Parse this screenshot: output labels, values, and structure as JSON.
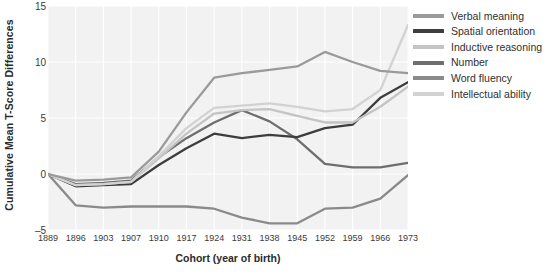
{
  "chart_data": {
    "type": "line",
    "title": "",
    "xlabel": "Cohort (year of birth)",
    "ylabel": "Cumulative Mean T-Score Differences",
    "categories": [
      1889,
      1896,
      1903,
      1907,
      1910,
      1917,
      1924,
      1931,
      1938,
      1945,
      1952,
      1959,
      1966,
      1973
    ],
    "xtick_labels": [
      "1889",
      "1896",
      "1903",
      "1907",
      "1910",
      "1917",
      "1924",
      "1931",
      "1938",
      "1945",
      "1952",
      "1959",
      "1966",
      "1973"
    ],
    "ytick_labels": [
      "15",
      "10",
      "5",
      "0",
      "–5"
    ],
    "ytick_values": [
      15,
      10,
      5,
      0,
      -5
    ],
    "ylim": [
      -5,
      15
    ],
    "grid": true,
    "legend_position": "right",
    "series": [
      {
        "name": "Verbal meaning",
        "color": "#9a9a9a",
        "values": [
          0.0,
          -0.6,
          -0.5,
          -0.3,
          2.0,
          5.5,
          8.6,
          9.0,
          9.3,
          9.6,
          10.9,
          10.0,
          9.2,
          9.0
        ]
      },
      {
        "name": "Spatial orientation",
        "color": "#3d3d3d",
        "values": [
          0.0,
          -1.1,
          -1.0,
          -0.9,
          0.8,
          2.3,
          3.6,
          3.2,
          3.5,
          3.3,
          4.1,
          4.4,
          6.8,
          8.2
        ]
      },
      {
        "name": "Inductive reasoning",
        "color": "#c4c4c4",
        "values": [
          0.0,
          -1.0,
          -0.9,
          -0.7,
          1.4,
          3.6,
          5.4,
          5.7,
          5.8,
          5.2,
          4.6,
          4.6,
          6.0,
          7.8
        ]
      },
      {
        "name": "Number",
        "color": "#6e6e6e",
        "values": [
          0.0,
          -0.9,
          -0.8,
          -0.6,
          1.5,
          3.2,
          4.6,
          5.7,
          4.7,
          3.1,
          0.9,
          0.6,
          0.6,
          1.0
        ]
      },
      {
        "name": "Word fluency",
        "color": "#8a8a8a",
        "values": [
          0.0,
          -2.8,
          -3.0,
          -2.9,
          -2.9,
          -2.9,
          -3.1,
          -3.9,
          -4.4,
          -4.4,
          -3.1,
          -3.0,
          -2.2,
          -0.1
        ]
      },
      {
        "name": "Intellectual ability",
        "color": "#d2d2d2",
        "values": [
          0.0,
          -1.0,
          -0.9,
          -0.7,
          1.6,
          4.1,
          5.9,
          6.1,
          6.3,
          6.0,
          5.6,
          5.8,
          7.5,
          13.3
        ]
      }
    ]
  },
  "style": {
    "plot_background": "#f2f2f2",
    "grid_color": "#ffffff",
    "page_background": "#ffffff",
    "axis_text_color": "#3a3a3a",
    "label_text_color": "#2b2b2b"
  }
}
